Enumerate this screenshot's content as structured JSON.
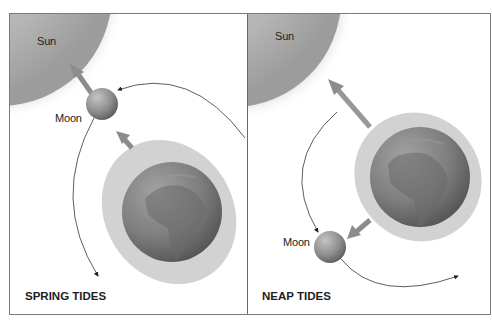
{
  "diagram": {
    "panels": [
      {
        "id": "spring",
        "title": "SPRING TIDES",
        "labels": {
          "sun": "Sun",
          "moon": "Moon"
        },
        "description": "Sun, Moon and Earth aligned; Moon between Sun and Earth; tidal bulge elongated toward Sun/Moon"
      },
      {
        "id": "neap",
        "title": "NEAP TIDES",
        "labels": {
          "sun": "Sun",
          "moon": "Moon"
        },
        "description": "Moon at right angle to Sun relative to Earth; tidal bulge less elongated"
      }
    ],
    "colors": {
      "sun_shade": "#a8a8a8",
      "earth": "#7c7c7c",
      "bulge": "#d0d0d0",
      "moon": "#8e8e8e",
      "arrow": "#8a8a8a",
      "frame": "#7a7a7a",
      "text": "#222222"
    }
  }
}
